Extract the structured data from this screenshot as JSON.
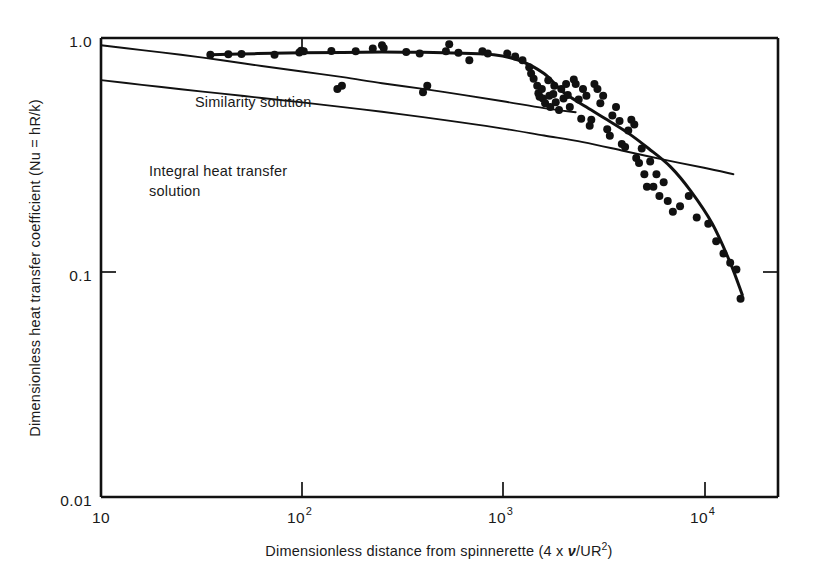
{
  "chart_data": {
    "type": "scatter",
    "title": "",
    "xlabel": "Dimensionless distance from spinnerette (4 x ν/UR²)",
    "ylabel": "Dimensionless heat transfer coefficient (Nu = hR/k)",
    "xscale": "log",
    "yscale": "log",
    "xlim": [
      10,
      20000
    ],
    "ylim": [
      0.01,
      1.0
    ],
    "grid": false,
    "legend_position": "inline-annotations",
    "xticks": [
      {
        "value": 10,
        "label": "10",
        "mantissa": "10",
        "exponent": ""
      },
      {
        "value": 100,
        "label": "10^2",
        "mantissa": "10",
        "exponent": "2"
      },
      {
        "value": 1000,
        "label": "10^3",
        "mantissa": "10",
        "exponent": "3"
      },
      {
        "value": 10000,
        "label": "10^4",
        "mantissa": "10",
        "exponent": "4"
      }
    ],
    "yticks": [
      {
        "value": 1.0,
        "label": "1.0"
      },
      {
        "value": 0.1,
        "label": "0.1"
      },
      {
        "value": 0.01,
        "label": "0.01"
      }
    ],
    "annotations": [
      {
        "name": "similarity-solution-label",
        "text": "Similarity solution",
        "x": 320,
        "y": 0.52
      },
      {
        "name": "integral-solution-label-line1",
        "text": "Integral heat transfer",
        "x": 210,
        "y": 0.3
      },
      {
        "name": "integral-solution-label-line2",
        "text": "solution",
        "x": 210,
        "y": 0.255
      }
    ],
    "series": [
      {
        "name": "Similarity solution",
        "type": "line",
        "points": [
          [
            10,
            0.93
          ],
          [
            16,
            0.885
          ],
          [
            25,
            0.845
          ],
          [
            40,
            0.8
          ],
          [
            63,
            0.755
          ],
          [
            100,
            0.715
          ],
          [
            160,
            0.675
          ],
          [
            250,
            0.635
          ],
          [
            400,
            0.6
          ],
          [
            630,
            0.565
          ],
          [
            1000,
            0.53
          ],
          [
            1600,
            0.495
          ],
          [
            2300,
            0.475
          ]
        ]
      },
      {
        "name": "Integral heat transfer solution",
        "type": "line",
        "points": [
          [
            10,
            0.655
          ],
          [
            16,
            0.625
          ],
          [
            25,
            0.598
          ],
          [
            40,
            0.572
          ],
          [
            63,
            0.548
          ],
          [
            100,
            0.524
          ],
          [
            160,
            0.5
          ],
          [
            250,
            0.477
          ],
          [
            400,
            0.452
          ],
          [
            630,
            0.428
          ],
          [
            1000,
            0.403
          ],
          [
            1600,
            0.376
          ],
          [
            2500,
            0.352
          ],
          [
            4000,
            0.322
          ],
          [
            6300,
            0.295
          ],
          [
            10000,
            0.272
          ],
          [
            14000,
            0.255
          ]
        ]
      },
      {
        "name": "Experimental best fit",
        "type": "line",
        "points": [
          [
            35,
            0.845
          ],
          [
            60,
            0.855
          ],
          [
            100,
            0.862
          ],
          [
            160,
            0.865
          ],
          [
            250,
            0.868
          ],
          [
            400,
            0.866
          ],
          [
            630,
            0.858
          ],
          [
            900,
            0.845
          ],
          [
            1200,
            0.8
          ],
          [
            1600,
            0.7
          ],
          [
            2000,
            0.58
          ],
          [
            2600,
            0.5
          ],
          [
            3300,
            0.44
          ],
          [
            4200,
            0.385
          ],
          [
            5300,
            0.33
          ],
          [
            6800,
            0.275
          ],
          [
            8600,
            0.215
          ],
          [
            11000,
            0.155
          ],
          [
            13500,
            0.105
          ],
          [
            15500,
            0.076
          ]
        ]
      },
      {
        "name": "Experimental data",
        "type": "scatter",
        "points": [
          [
            35,
            0.845
          ],
          [
            43,
            0.85
          ],
          [
            50,
            0.852
          ],
          [
            73,
            0.845
          ],
          [
            97,
            0.865
          ],
          [
            99,
            0.88
          ],
          [
            102,
            0.875
          ],
          [
            140,
            0.878
          ],
          [
            150,
            0.6
          ],
          [
            158,
            0.62
          ],
          [
            185,
            0.875
          ],
          [
            225,
            0.9
          ],
          [
            250,
            0.93
          ],
          [
            255,
            0.905
          ],
          [
            330,
            0.868
          ],
          [
            385,
            0.855
          ],
          [
            400,
            0.58
          ],
          [
            420,
            0.62
          ],
          [
            520,
            0.875
          ],
          [
            540,
            0.94
          ],
          [
            600,
            0.862
          ],
          [
            680,
            0.8
          ],
          [
            790,
            0.875
          ],
          [
            840,
            0.855
          ],
          [
            1050,
            0.855
          ],
          [
            1150,
            0.83
          ],
          [
            1250,
            0.8
          ],
          [
            1350,
            0.745
          ],
          [
            1380,
            0.7
          ],
          [
            1420,
            0.665
          ],
          [
            1480,
            0.62
          ],
          [
            1500,
            0.575
          ],
          [
            1520,
            0.555
          ],
          [
            1560,
            0.6
          ],
          [
            1580,
            0.545
          ],
          [
            1620,
            0.52
          ],
          [
            1680,
            0.655
          ],
          [
            1700,
            0.56
          ],
          [
            1720,
            0.5
          ],
          [
            1780,
            0.57
          ],
          [
            1800,
            0.62
          ],
          [
            1830,
            0.525
          ],
          [
            1900,
            0.485
          ],
          [
            1950,
            0.6
          ],
          [
            2000,
            0.545
          ],
          [
            2060,
            0.63
          ],
          [
            2100,
            0.565
          ],
          [
            2150,
            0.5
          ],
          [
            2250,
            0.66
          ],
          [
            2300,
            0.63
          ],
          [
            2380,
            0.54
          ],
          [
            2450,
            0.445
          ],
          [
            2500,
            0.6
          ],
          [
            2600,
            0.56
          ],
          [
            2700,
            0.415
          ],
          [
            2750,
            0.44
          ],
          [
            2850,
            0.63
          ],
          [
            2950,
            0.6
          ],
          [
            3050,
            0.52
          ],
          [
            3150,
            0.56
          ],
          [
            3300,
            0.4
          ],
          [
            3400,
            0.375
          ],
          [
            3500,
            0.46
          ],
          [
            3650,
            0.5
          ],
          [
            3800,
            0.435
          ],
          [
            3900,
            0.345
          ],
          [
            4050,
            0.335
          ],
          [
            4200,
            0.395
          ],
          [
            4350,
            0.44
          ],
          [
            4500,
            0.42
          ],
          [
            4600,
            0.3
          ],
          [
            4750,
            0.285
          ],
          [
            4900,
            0.33
          ],
          [
            5050,
            0.255
          ],
          [
            5200,
            0.225
          ],
          [
            5400,
            0.29
          ],
          [
            5600,
            0.225
          ],
          [
            5800,
            0.255
          ],
          [
            6000,
            0.205
          ],
          [
            6300,
            0.235
          ],
          [
            6600,
            0.195
          ],
          [
            7000,
            0.175
          ],
          [
            7600,
            0.185
          ],
          [
            8400,
            0.205
          ],
          [
            9200,
            0.165
          ],
          [
            10500,
            0.155
          ],
          [
            11500,
            0.13
          ],
          [
            12500,
            0.115
          ],
          [
            13500,
            0.105
          ],
          [
            14500,
            0.098
          ],
          [
            15200,
            0.073
          ]
        ]
      }
    ]
  },
  "axes": {
    "x_title_prefix": "Dimensionless distance from spinnerette (4 x ",
    "x_title_nu": "ν",
    "x_title_mid": "/UR",
    "x_title_sup": "2",
    "x_title_suffix": ")",
    "y_title": "Dimensionless heat transfer coefficient (Nu = hR/k)"
  },
  "colors": {
    "ink": "#111111",
    "background": "#ffffff",
    "marker": "#111111"
  }
}
